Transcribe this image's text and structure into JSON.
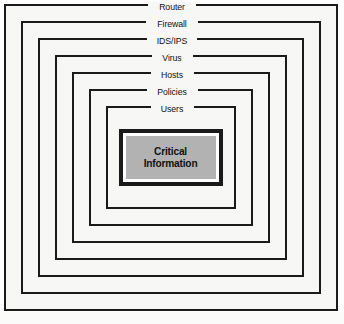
{
  "figure": {
    "name": "defense-in-depth-layered-security-diagram",
    "type": "concentric-rectangles",
    "background_color": "#f7f7f5",
    "line_color": "#1a1a1a",
    "core": {
      "label_line_1": "Critical",
      "label_line_2": "Information",
      "fill_color": "#b2b2b2",
      "border_color": "#1a1a1a"
    },
    "layers": [
      {
        "label": "Router",
        "order": 1
      },
      {
        "label": "Firewall",
        "order": 2
      },
      {
        "label": "IDS/IPS",
        "order": 3
      },
      {
        "label": "Virus",
        "order": 4
      },
      {
        "label": "Hosts",
        "order": 5
      },
      {
        "label": "Policies",
        "order": 6
      },
      {
        "label": "Users",
        "order": 7
      }
    ]
  }
}
